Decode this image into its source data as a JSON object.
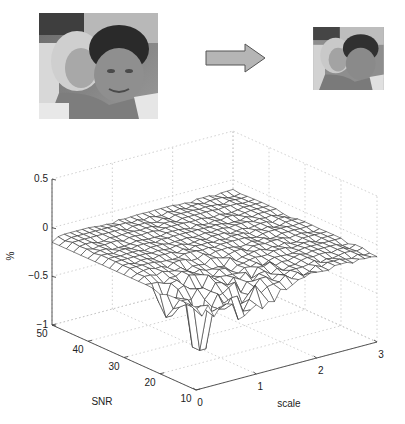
{
  "figure": {
    "original_image": {
      "label": "original photo (two children)",
      "tone": "grayscale"
    },
    "arrow": {
      "fill": "#b5b5b5",
      "stroke": "#555555",
      "direction": "right"
    },
    "scaled_image": {
      "label": "downscaled photo (two children)",
      "tone": "grayscale"
    }
  },
  "chart_data": {
    "type": "surface",
    "title": "",
    "xlabel": "scale",
    "ylabel": "SNR",
    "zlabel": "%",
    "x_ticks": [
      "0",
      "1",
      "2",
      "3"
    ],
    "y_ticks": [
      "10",
      "20",
      "30",
      "40",
      "50"
    ],
    "z_ticks": [
      "0.5",
      "0",
      "-0.5",
      "-1"
    ],
    "xlim": [
      0,
      3
    ],
    "ylim": [
      10,
      50
    ],
    "zlim": [
      -1,
      0.5
    ],
    "grid": true,
    "mesh_color": "#333333",
    "face_color": "#ffffff",
    "surface_summary": {
      "baseline_z": -0.1,
      "min_z": -0.95,
      "min_at": {
        "scale": 0.35,
        "SNR": 15
      },
      "grid_x_count": 30,
      "grid_y_count": 20
    }
  }
}
